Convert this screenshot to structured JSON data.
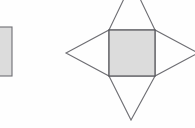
{
  "figure": {
    "canvas": {
      "width": 195,
      "height": 128,
      "background": "#fefefe"
    },
    "style": {
      "fill_gray": "#dcdcdc",
      "fill_white": "#fefefe",
      "stroke_dark": "#55555a",
      "stroke_mid": "#6e6e73",
      "stroke_width": 1.1
    },
    "shapes": [
      {
        "id": "left-rectangle",
        "label": "Partially cropped rectangle",
        "type": "rectangle",
        "clipped": "left edge of canvas",
        "x": -10,
        "y": 27,
        "width": 22,
        "height": 49,
        "fill": "#dcdcdc",
        "stroke": "#6e6e73"
      },
      {
        "id": "star-net",
        "label": "Four pointed star net",
        "type": "polygon-group",
        "center_square": {
          "id": "center-square",
          "label": "Central square face",
          "x": 109,
          "y": 30,
          "width": 46,
          "height": 46,
          "fill": "#dcdcdc",
          "stroke": "#55555a"
        },
        "triangles": [
          {
            "id": "triangle-top",
            "label": "Top triangular flap",
            "points": "109,30 155,30 132,-18",
            "apex": [
              132,
              -18
            ],
            "clipped": "top edge of canvas",
            "fill": "#fefefe",
            "stroke": "#6e6e73"
          },
          {
            "id": "triangle-bottom",
            "label": "Bottom triangular flap",
            "points": "109,76 155,76 131,120",
            "apex": [
              131,
              120
            ],
            "clipped": "none",
            "fill": "#fefefe",
            "stroke": "#6e6e73"
          },
          {
            "id": "triangle-left",
            "label": "Left triangular flap",
            "points": "109,30 109,76 66,53",
            "apex": [
              66,
              53
            ],
            "clipped": "none",
            "fill": "#fefefe",
            "stroke": "#6e6e73"
          },
          {
            "id": "triangle-right",
            "label": "Right triangular flap",
            "points": "155,30 155,76 198,53",
            "apex": [
              198,
              53
            ],
            "clipped": "right edge of canvas",
            "fill": "#fefefe",
            "stroke": "#6e6e73"
          }
        ]
      }
    ]
  }
}
